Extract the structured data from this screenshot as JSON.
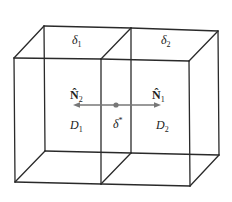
{
  "diagram": {
    "type": "two adjacent 3D boxes sharing a common face",
    "labels": {
      "top_face_left": "δ",
      "top_face_left_sub": "1",
      "top_face_right": "δ",
      "top_face_right_sub": "2",
      "normal_left": "N̂",
      "normal_left_sub": "2",
      "normal_right": "N̂",
      "normal_right_sub": "1",
      "domain_left": "D",
      "domain_left_sub": "1",
      "domain_right": "D",
      "domain_right_sub": "2",
      "interface": "δ",
      "interface_sup": "*"
    },
    "colors": {
      "edges": "#2a2a2a",
      "arrow": "#777777",
      "point": "#777777"
    }
  }
}
